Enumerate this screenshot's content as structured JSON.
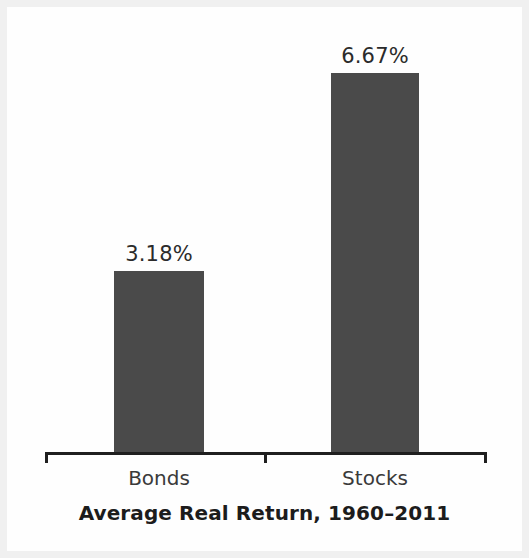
{
  "chart_data": {
    "type": "bar",
    "title": "Average Real Return, 1960–2011",
    "xlabel": "",
    "ylabel": "",
    "categories": [
      "Bonds",
      "Stocks"
    ],
    "values": [
      3.18,
      6.67
    ],
    "value_labels": [
      "3.18%",
      "6.67%"
    ],
    "unit": "percent",
    "ylim": [
      0,
      7.6
    ],
    "grid": false,
    "legend": null,
    "axis": {
      "show_x_axis_line": true,
      "show_y_axis_line": false,
      "tick_positions": [
        "left-end",
        "center",
        "right-end"
      ],
      "tick_labels": []
    },
    "series": [
      {
        "name": "Average Real Return",
        "values": [
          3.18,
          6.67
        ],
        "color": "#4a4a4a"
      }
    ],
    "annotations": [
      {
        "target": "Bonds",
        "text": "3.18%",
        "position": "above-bar"
      },
      {
        "target": "Stocks",
        "text": "6.67%",
        "position": "above-bar"
      }
    ]
  },
  "colors": {
    "bar_fill": "#4a4a4a",
    "axis": "#1f1f1f",
    "title_text": "#1c1c1c",
    "value_text": "#2b2b2b",
    "category_text": "#3a3a3a",
    "plot_background": "#fefefe",
    "page_border": "#f0f0f0"
  }
}
